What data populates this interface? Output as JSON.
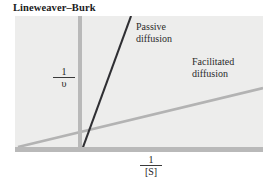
{
  "figure": {
    "title": "Lineweaver–Burk",
    "background_color": "#ffffff",
    "panel_color": "#ededec",
    "axis_color": "#b9b9b9"
  },
  "axes": {
    "y_numerator": "1",
    "y_denominator": "υ",
    "x_numerator": "1",
    "x_denominator": "[S]"
  },
  "annotations": {
    "passive_line1": "Passive",
    "passive_line2": "diffusion",
    "facilitated_line1": "Facilitated",
    "facilitated_line2": "diffusion"
  },
  "chart_data": {
    "type": "line",
    "title": "Lineweaver–Burk",
    "xlabel": "1/[S]",
    "ylabel": "1/υ",
    "grid": false,
    "legend": "inline-annotations",
    "xlim": [
      0,
      1
    ],
    "ylim": [
      0,
      1
    ],
    "series": [
      {
        "name": "Passive diffusion",
        "color": "#2f2f33",
        "width": 2.1,
        "points": [
          [
            0.27,
            0.0
          ],
          [
            0.468,
            1.0
          ]
        ],
        "note": "Steep line passing through origin region of the 1/[S] axis; slope high, y-intercept near zero"
      },
      {
        "name": "Facilitated diffusion",
        "color": "#b3b3b3",
        "width": 2.6,
        "points": [
          [
            0.012,
            0.022
          ],
          [
            1.0,
            0.462
          ]
        ],
        "note": "Shallow line with a positive y-intercept, indicating saturable carrier-mediated transport"
      }
    ]
  }
}
